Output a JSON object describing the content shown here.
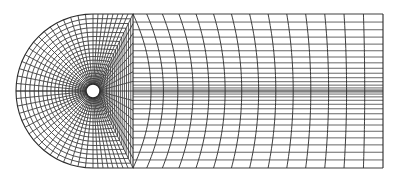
{
  "diagram": {
    "type": "finite-element mesh",
    "line_color": "#2a2a2a",
    "background": "#ffffff",
    "hole": {
      "cx": 93,
      "cy": 91,
      "r": 7
    },
    "outer": {
      "cx": 93,
      "cy": 91,
      "r": 77,
      "right_x": 383
    },
    "radial_lines": 64,
    "rings": 20,
    "tail_columns": 14,
    "tail_rows": 30
  }
}
